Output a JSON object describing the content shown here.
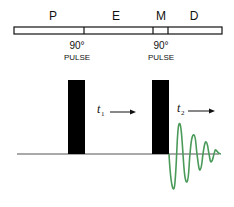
{
  "segments": [
    {
      "label": "P",
      "x0": 14,
      "x1": 84
    },
    {
      "label": "E",
      "x0": 84,
      "x1": 153
    },
    {
      "label": "M",
      "x0": 153,
      "x1": 168
    },
    {
      "label": "D",
      "x0": 168,
      "x1": 222
    }
  ],
  "pulses": [
    {
      "angle": "90°",
      "word": "PULSE",
      "x": 68,
      "width": 17
    },
    {
      "angle": "90°",
      "word": "PULSE",
      "x": 152,
      "width": 17
    }
  ],
  "periods": [
    {
      "var": "t",
      "sub": "1"
    },
    {
      "var": "t",
      "sub": "2"
    }
  ],
  "colors": {
    "ink": "#000000",
    "baseline": "#555555",
    "fid": "#4a9a5a"
  }
}
